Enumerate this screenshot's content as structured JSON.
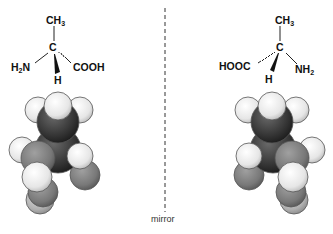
{
  "diagram": {
    "mirror_label": "mirror",
    "left_molecule": {
      "top": "CH",
      "top_sub": "3",
      "center": "C",
      "left": "H",
      "left_sub": "2",
      "left_tail": "N",
      "right": "COOH",
      "bottom": "H"
    },
    "right_molecule": {
      "top": "CH",
      "top_sub": "3",
      "center": "C",
      "left": "HOOC",
      "right": "NH",
      "right_sub": "2",
      "bottom": "H"
    },
    "colors": {
      "line": "#222222",
      "dark_atom": "#3a3a3a",
      "mid_atom": "#7a7a7a",
      "light_atom": "#eeeeee"
    }
  }
}
